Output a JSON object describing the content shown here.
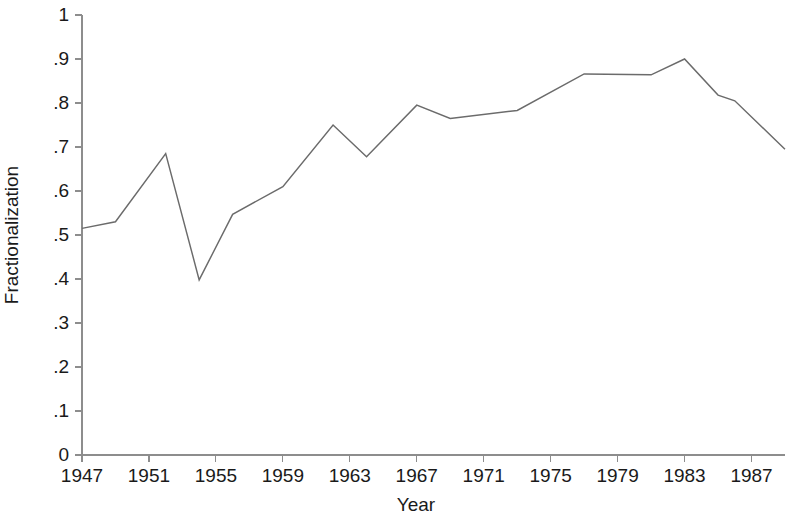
{
  "chart_data": {
    "type": "line",
    "title": "",
    "xlabel": "Year",
    "ylabel": "Fractionalization",
    "xlim": [
      1947,
      1989
    ],
    "ylim": [
      0,
      1
    ],
    "grid": false,
    "legend": null,
    "line_color": "#6b6b6b",
    "axis_color": "#8d8d8d",
    "x_tick_labels": [
      "1947",
      "1951",
      "1955",
      "1959",
      "1963",
      "1967",
      "1971",
      "1975",
      "1979",
      "1983",
      "1987"
    ],
    "x_tick_values": [
      1947,
      1951,
      1955,
      1959,
      1963,
      1967,
      1971,
      1975,
      1979,
      1983,
      1987
    ],
    "y_tick_labels": [
      "0",
      ".1",
      ".2",
      ".3",
      ".4",
      ".5",
      ".6",
      ".7",
      ".8",
      ".9",
      "1"
    ],
    "y_tick_values": [
      0,
      0.1,
      0.2,
      0.3,
      0.4,
      0.5,
      0.6,
      0.7,
      0.8,
      0.9,
      1
    ],
    "series": [
      {
        "name": "Fractionalization",
        "x": [
          1947,
          1949,
          1952,
          1954,
          1956,
          1959,
          1962,
          1964,
          1967,
          1969,
          1973,
          1977,
          1981,
          1983,
          1985,
          1986,
          1989
        ],
        "values": [
          0.515,
          0.53,
          0.685,
          0.398,
          0.547,
          0.61,
          0.75,
          0.678,
          0.795,
          0.765,
          0.783,
          0.866,
          0.864,
          0.9,
          0.818,
          0.805,
          0.695
        ]
      }
    ]
  }
}
